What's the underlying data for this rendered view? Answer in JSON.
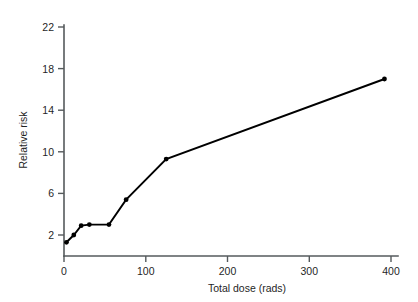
{
  "chart_data": {
    "type": "line",
    "title": "",
    "xlabel": "Total dose (rads)",
    "ylabel": "Relative risk",
    "xlim": [
      0,
      400
    ],
    "ylim": [
      0,
      22
    ],
    "xticks": [
      0,
      100,
      200,
      300,
      400
    ],
    "xtick_labels": [
      "0",
      "100",
      "200",
      "300",
      "400"
    ],
    "yticks": [
      2,
      6,
      10,
      14,
      18,
      22
    ],
    "ytick_labels": [
      "2",
      "6",
      "10",
      "14",
      "18",
      "22"
    ],
    "grid": false,
    "legend": null,
    "markers": "filled-circle",
    "line_color": "#000000",
    "axis_color": "#555a5c",
    "series": [
      {
        "name": "Relative risk vs total dose",
        "x": [
          3,
          12,
          21,
          31,
          55,
          76,
          125,
          392
        ],
        "y": [
          1.3,
          2.0,
          2.9,
          3.0,
          3.0,
          5.4,
          9.3,
          17.0
        ]
      }
    ],
    "annotations": []
  },
  "figure": {
    "background_color": "#ffffff",
    "x_axis_title": "Total dose (rads)",
    "y_axis_title": "Relative risk"
  }
}
